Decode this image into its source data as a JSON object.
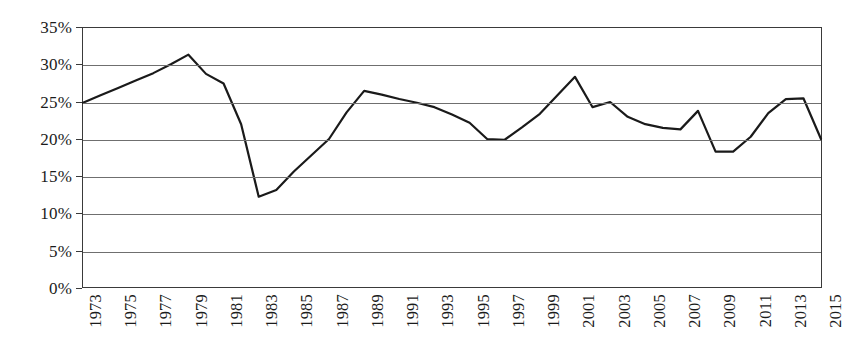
{
  "chart_data": {
    "type": "line",
    "title": "",
    "subtitle": "",
    "xlabel": "",
    "ylabel": "",
    "legend": [],
    "legend_position": "none",
    "grid": true,
    "grid_axis": "y",
    "xlim": [
      1973,
      2015
    ],
    "ylim": [
      0,
      35
    ],
    "y_tick_step": 5,
    "y_tick_labels": [
      "0%",
      "5%",
      "10%",
      "15%",
      "20%",
      "25%",
      "30%",
      "35%"
    ],
    "y_tick_values": [
      0,
      5,
      10,
      15,
      20,
      25,
      30,
      35
    ],
    "x_tick_labels": [
      "1973",
      "1975",
      "1977",
      "1979",
      "1981",
      "1983",
      "1985",
      "1987",
      "1989",
      "1991",
      "1993",
      "1995",
      "1997",
      "1999",
      "2001",
      "2003",
      "2005",
      "2007",
      "2009",
      "2011",
      "2013",
      "2015"
    ],
    "x_tick_values": [
      1973,
      1975,
      1977,
      1979,
      1981,
      1983,
      1985,
      1987,
      1989,
      1991,
      1993,
      1995,
      1997,
      1999,
      2001,
      2003,
      2005,
      2007,
      2009,
      2011,
      2013,
      2015
    ],
    "x": [
      1973,
      1974,
      1975,
      1976,
      1977,
      1978,
      1979,
      1980,
      1981,
      1982,
      1983,
      1984,
      1985,
      1986,
      1987,
      1988,
      1989,
      1990,
      1991,
      1992,
      1993,
      1994,
      1995,
      1996,
      1997,
      1998,
      1999,
      2000,
      2001,
      2002,
      2003,
      2004,
      2005,
      2006,
      2007,
      2008,
      2009,
      2010,
      2011,
      2012,
      2013,
      2014,
      2015
    ],
    "values": [
      24.9,
      25.9,
      26.9,
      27.9,
      28.9,
      30.1,
      31.4,
      28.8,
      27.5,
      22.0,
      12.2,
      13.1,
      15.6,
      17.8,
      20.0,
      23.6,
      26.5,
      26.0,
      25.4,
      24.9,
      24.3,
      23.3,
      22.2,
      20.0,
      19.9,
      21.6,
      23.4,
      25.9,
      28.4,
      24.3,
      25.0,
      23.0,
      22.0,
      21.5,
      21.3,
      23.8,
      18.3,
      18.3,
      20.3,
      23.5,
      25.4,
      25.5,
      20.0
    ],
    "series": [
      {
        "name": "series-1",
        "color": "#1a1a1a",
        "line_width": 2.2,
        "markers": false,
        "values": [
          24.9,
          25.9,
          26.9,
          27.9,
          28.9,
          30.1,
          31.4,
          28.8,
          27.5,
          22.0,
          12.2,
          13.1,
          15.6,
          17.8,
          20.0,
          23.6,
          26.5,
          26.0,
          25.4,
          24.9,
          24.3,
          23.3,
          22.2,
          20.0,
          19.9,
          21.6,
          23.4,
          25.9,
          28.4,
          24.3,
          25.0,
          23.0,
          22.0,
          21.5,
          21.3,
          23.8,
          18.3,
          18.3,
          20.3,
          23.5,
          25.4,
          25.5,
          20.0
        ]
      }
    ],
    "annotations": [],
    "colors": {
      "line": "#1a1a1a",
      "gridline": "#6f6f6f",
      "frame": "#3a3a3a",
      "text": "#1b1b1b",
      "background": "#ffffff"
    }
  }
}
